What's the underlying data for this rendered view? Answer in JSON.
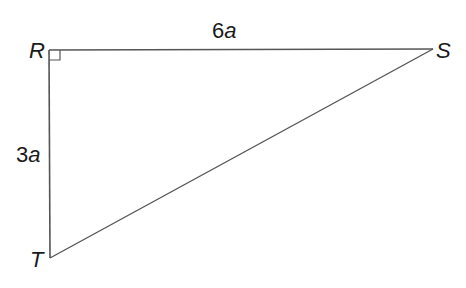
{
  "diagram": {
    "type": "right-triangle",
    "vertices": {
      "R": {
        "label": "R",
        "x": 49,
        "y": 50
      },
      "S": {
        "label": "S",
        "x": 433,
        "y": 49
      },
      "T": {
        "label": "T",
        "x": 50,
        "y": 258
      }
    },
    "right_angle_at": "R",
    "sides": {
      "RS": {
        "coef": "6",
        "var": "a"
      },
      "RT": {
        "coef": "3",
        "var": "a"
      }
    },
    "line_color": "#555555",
    "text_color": "#1a1a1a"
  }
}
